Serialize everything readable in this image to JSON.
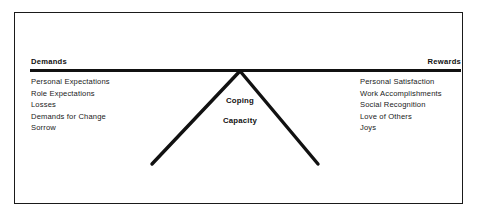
{
  "diagram": {
    "beam": {
      "left_heading": "Demands",
      "right_heading": "Rewards"
    },
    "fulcrum": {
      "line_one": "Coping",
      "line_two": "Capacity"
    },
    "left_column": {
      "heading": "Demands",
      "items": [
        "Personal Expectations",
        "Role Expectations",
        "Losses",
        "Demands for Change",
        "Sorrow"
      ]
    },
    "right_column": {
      "heading": "Rewards",
      "items": [
        "Personal Satisfaction",
        "Work Accomplishments",
        "Social Recognition",
        "Love of Others",
        "Joys"
      ]
    },
    "colors": {
      "ink": "#111111",
      "frame": "#1a1a1a",
      "background": "#ffffff"
    }
  }
}
